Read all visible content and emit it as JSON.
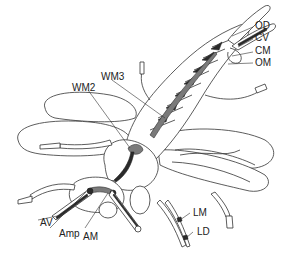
{
  "figure": {
    "colors": {
      "line": "#333333",
      "muscle_dark": "#2a2a2a",
      "muscle_mid": "#7a7a7a",
      "background": "#ffffff"
    }
  },
  "labels": {
    "od": "OD",
    "cv": "CV",
    "cm": "CM",
    "om": "OM",
    "wm3": "WM3",
    "wm2": "WM2",
    "av": "AV",
    "amp": "Amp",
    "am": "AM",
    "lm": "LM",
    "ld": "LD"
  }
}
